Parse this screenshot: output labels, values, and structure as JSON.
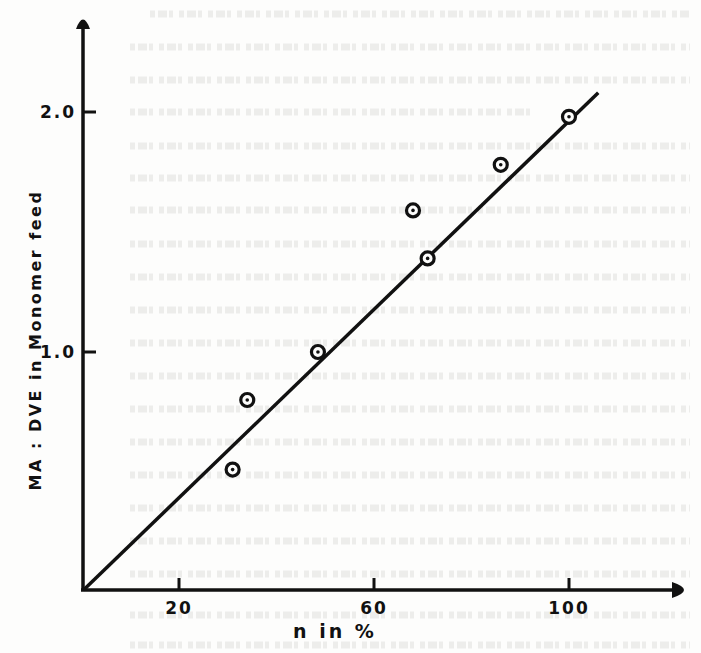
{
  "chart_data": {
    "type": "scatter",
    "title": "",
    "xlabel": "n in %",
    "ylabel": "MA : DVE in Monomer feed",
    "xlim": [
      0,
      125
    ],
    "ylim": [
      0,
      2.4
    ],
    "x_ticks": [
      {
        "value": 20,
        "label": "20"
      },
      {
        "value": 60,
        "label": "60"
      },
      {
        "value": 100,
        "label": "100"
      }
    ],
    "y_ticks": [
      {
        "value": 1.0,
        "label": "1.0"
      },
      {
        "value": 2.0,
        "label": "2.0"
      }
    ],
    "grid": false,
    "legend": null,
    "series": [
      {
        "name": "measured",
        "type": "scatter",
        "marker": "circle-dot",
        "points": [
          {
            "x": 31,
            "y": 0.51
          },
          {
            "x": 34,
            "y": 0.8
          },
          {
            "x": 48.5,
            "y": 1.0
          },
          {
            "x": 68,
            "y": 1.59
          },
          {
            "x": 71,
            "y": 1.39
          },
          {
            "x": 86,
            "y": 1.78
          },
          {
            "x": 100,
            "y": 1.98
          }
        ]
      },
      {
        "name": "linear fit",
        "type": "line",
        "points": [
          {
            "x": 0,
            "y": 0.0
          },
          {
            "x": 106,
            "y": 2.08
          }
        ]
      }
    ]
  },
  "axes": {
    "x_title": "n in %",
    "y_title": "MA : DVE in Monomer feed"
  },
  "colors": {
    "ink": "#111111",
    "paper": "#fdfdfc"
  }
}
